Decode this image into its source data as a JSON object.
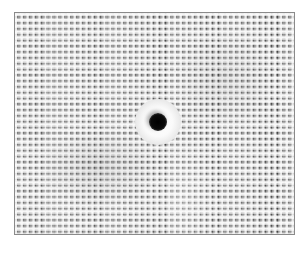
{
  "image": {
    "subject": "Close-up of loosely woven white fabric with a single round eyelet hole in the center",
    "colors": {
      "background": "#ffffff",
      "fabric": "#f2f2f2",
      "weave_gaps": "#2a2a2a",
      "hole": "#000000",
      "border": "#8a8a8a"
    }
  }
}
